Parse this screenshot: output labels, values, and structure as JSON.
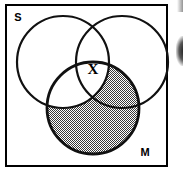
{
  "figure": {
    "kind": "venn-diagram",
    "background_color": "#ffffff",
    "ink_color": "#000000",
    "shade_color": "#8c8c8c",
    "border": {
      "x": 5,
      "y": 4,
      "width": 163,
      "height": 163,
      "stroke_width": 2
    }
  },
  "labels": {
    "set_s": "S",
    "set_m": "M",
    "mark_x": "X"
  },
  "circles": [
    {
      "id": "circle-s",
      "label": "S",
      "cx": 63,
      "cy": 62,
      "r": 46,
      "shaded": false
    },
    {
      "id": "circle-right",
      "label": "",
      "cx": 122,
      "cy": 62,
      "r": 46,
      "shaded": false
    },
    {
      "id": "circle-m",
      "label": "M",
      "cx": 93,
      "cy": 108,
      "r": 46,
      "shaded": true
    }
  ],
  "regions": {
    "m_only_shaded": true,
    "m_and_right_shaded": true,
    "m_and_s_shaded": false,
    "triple_intersection_shaded": false
  },
  "marks": [
    {
      "id": "x-mark",
      "glyph": "X",
      "x": 93,
      "y": 69,
      "region": "triple-intersection"
    }
  ],
  "label_positions": {
    "set_s": {
      "x": 18,
      "y": 17
    },
    "set_m": {
      "x": 145,
      "y": 152
    }
  }
}
